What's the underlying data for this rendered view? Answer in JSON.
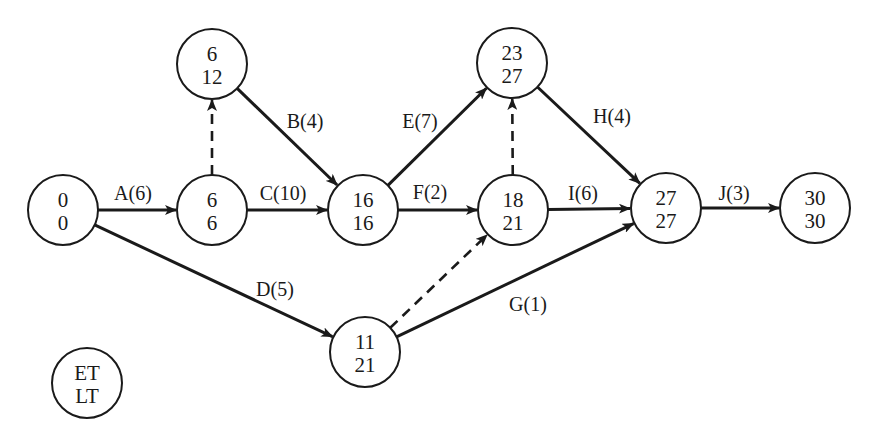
{
  "diagram": {
    "type": "activity-on-arrow network (PERT/CPM)",
    "legend": {
      "top": "ET",
      "bottom": "LT",
      "x": 87,
      "y": 383
    },
    "nodes": [
      {
        "id": "n0",
        "et": "0",
        "lt": "0",
        "x": 63,
        "y": 210
      },
      {
        "id": "n6a",
        "et": "6",
        "lt": "6",
        "x": 212,
        "y": 210
      },
      {
        "id": "n6b",
        "et": "6",
        "lt": "12",
        "x": 212,
        "y": 64
      },
      {
        "id": "n16",
        "et": "16",
        "lt": "16",
        "x": 363,
        "y": 210
      },
      {
        "id": "n23",
        "et": "23",
        "lt": "27",
        "x": 512,
        "y": 63
      },
      {
        "id": "n18",
        "et": "18",
        "lt": "21",
        "x": 513,
        "y": 210
      },
      {
        "id": "n11",
        "et": "11",
        "lt": "21",
        "x": 365,
        "y": 352
      },
      {
        "id": "n27",
        "et": "27",
        "lt": "27",
        "x": 666,
        "y": 208
      },
      {
        "id": "n30",
        "et": "30",
        "lt": "30",
        "x": 815,
        "y": 208
      }
    ],
    "edges": [
      {
        "from": "n0",
        "to": "n6a",
        "label": "A(6)",
        "dashed": false,
        "lx": 133,
        "ly": 200
      },
      {
        "from": "n6b",
        "to": "n16",
        "label": "B(4)",
        "dashed": false,
        "lx": 305,
        "ly": 128
      },
      {
        "from": "n6a",
        "to": "n16",
        "label": "C(10)",
        "dashed": false,
        "lx": 283,
        "ly": 200
      },
      {
        "from": "n0",
        "to": "n11",
        "label": "D(5)",
        "dashed": false,
        "lx": 275,
        "ly": 296
      },
      {
        "from": "n16",
        "to": "n23",
        "label": "E(7)",
        "dashed": false,
        "lx": 420,
        "ly": 128
      },
      {
        "from": "n16",
        "to": "n18",
        "label": "F(2)",
        "dashed": false,
        "lx": 430,
        "ly": 199
      },
      {
        "from": "n11",
        "to": "n27",
        "label": "G(1)",
        "dashed": false,
        "lx": 528,
        "ly": 311
      },
      {
        "from": "n23",
        "to": "n27",
        "label": "H(4)",
        "dashed": false,
        "lx": 612,
        "ly": 123
      },
      {
        "from": "n18",
        "to": "n27",
        "label": "I(6)",
        "dashed": false,
        "lx": 583,
        "ly": 200
      },
      {
        "from": "n27",
        "to": "n30",
        "label": "J(3)",
        "dashed": false,
        "lx": 734,
        "ly": 200
      },
      {
        "from": "n6a",
        "to": "n6b",
        "label": "",
        "dashed": true
      },
      {
        "from": "n18",
        "to": "n23",
        "label": "",
        "dashed": true
      },
      {
        "from": "n11",
        "to": "n18",
        "label": "",
        "dashed": true
      }
    ],
    "node_radius": 35
  }
}
